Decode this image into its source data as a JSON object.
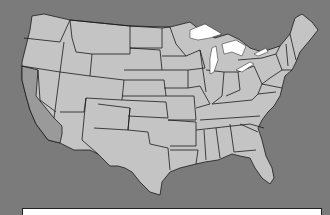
{
  "map": {
    "title": "",
    "region": "Contiguous United States",
    "highlighted_state": "California",
    "colors": {
      "background": "#7b7b7b",
      "land": "#c4c4c4",
      "highlight": "#9a9a9a",
      "lakes": "#ffffff",
      "borders": "#1a1a1a"
    }
  },
  "caption": {
    "text": ""
  }
}
